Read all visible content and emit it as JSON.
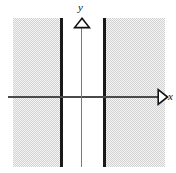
{
  "figure": {
    "type": "math-graph",
    "background_color": "#ffffff"
  },
  "axes": {
    "x": {
      "label": "x",
      "arrow_icon": "open-triangle-right-icon",
      "color": "#4a4a4a",
      "direction": "right"
    },
    "y": {
      "label": "y",
      "arrow_icon": "open-triangle-up-icon",
      "color": "#7a7a7a",
      "direction": "up"
    }
  },
  "regions": [
    {
      "name": "left-shaded-region",
      "fill_color": "#d2d2d2",
      "fill_style": "dither",
      "side": "left"
    },
    {
      "name": "right-shaded-region",
      "fill_color": "#d2d2d2",
      "fill_style": "dither",
      "side": "right"
    }
  ],
  "boundaries": [
    {
      "name": "left-boundary-line",
      "style": "solid",
      "orientation": "vertical",
      "color": "#1a1a1a",
      "inclusive": true
    },
    {
      "name": "right-boundary-line",
      "style": "solid",
      "orientation": "vertical",
      "color": "#1a1a1a",
      "inclusive": true
    }
  ]
}
